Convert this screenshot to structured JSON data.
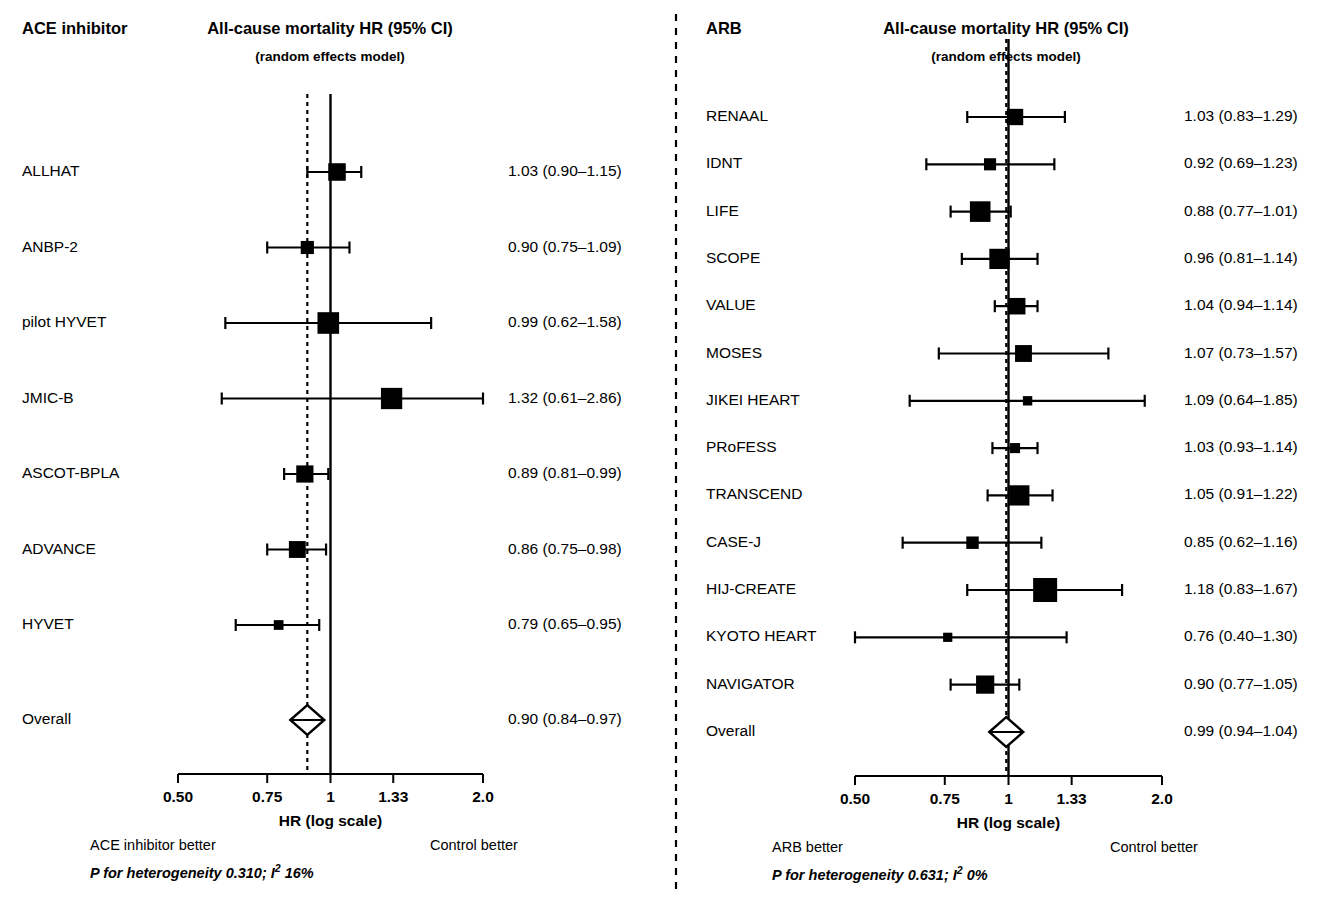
{
  "figure": {
    "title_common": "All-cause mortality HR (95% CI)",
    "subtitle_common": "(random effects model)",
    "axis_title": "HR (log scale)",
    "control_label": "Control better",
    "overall_label": "Overall",
    "tick_labels": [
      "0.50",
      "0.75",
      "1",
      "1.33",
      "2.0"
    ],
    "tick_values": [
      0.5,
      0.75,
      1,
      1.33,
      2.0
    ],
    "axis_min": 0.5,
    "axis_max": 2.0,
    "null_value": 1,
    "line_color": "#000000",
    "background_color": "#ffffff"
  },
  "panels": [
    {
      "id": "ace-inhibitor",
      "group_label": "ACE inhibitor",
      "title": "All-cause mortality HR (95% CI)",
      "subtitle": "(random effects model)",
      "better_label": "ACE inhibitor better",
      "control_label": "Control better",
      "axis_title": "HR (log scale)",
      "heterogeneity": {
        "prefix": "P for heterogeneity 0.310; I",
        "sup": "2",
        "suffix": " 16%",
        "p_value": "0.310",
        "i2": "16%",
        "full": "P for heterogeneity 0.310; I2 16%"
      },
      "overall": {
        "label": "Overall",
        "value_text": "0.90 (0.84–0.97)",
        "hr": 0.9,
        "lower": 0.84,
        "upper": 0.97
      },
      "studies": [
        {
          "label": "ALLHAT",
          "value_text": "1.03 (0.90–1.15)",
          "hr": 1.03,
          "lower": 0.9,
          "upper": 1.15,
          "weight": 0.62
        },
        {
          "label": "ANBP-2",
          "value_text": "0.90 (0.75–1.09)",
          "hr": 0.9,
          "lower": 0.75,
          "upper": 1.09,
          "weight": 0.36
        },
        {
          "label": "pilot HYVET",
          "value_text": "0.99 (0.62–1.58)",
          "hr": 0.99,
          "lower": 0.62,
          "upper": 1.58,
          "weight": 0.86
        },
        {
          "label": "JMIC-B",
          "value_text": "1.32 (0.61–2.86)",
          "hr": 1.32,
          "lower": 0.61,
          "upper": 2.86,
          "weight": 0.84
        },
        {
          "label": "ASCOT-BPLA",
          "value_text": "0.89 (0.81–0.99)",
          "hr": 0.89,
          "lower": 0.81,
          "upper": 0.99,
          "weight": 0.6
        },
        {
          "label": "ADVANCE",
          "value_text": "0.86 (0.75–0.98)",
          "hr": 0.86,
          "lower": 0.75,
          "upper": 0.98,
          "weight": 0.58
        },
        {
          "label": "HYVET",
          "value_text": "0.79 (0.65–0.95)",
          "hr": 0.79,
          "lower": 0.65,
          "upper": 0.95,
          "weight": 0.16
        }
      ]
    },
    {
      "id": "arb",
      "group_label": "ARB",
      "title": "All-cause mortality HR (95% CI)",
      "subtitle": "(random effects model)",
      "better_label": "ARB better",
      "control_label": "Control better",
      "axis_title": "HR (log scale)",
      "heterogeneity": {
        "prefix": "P for heterogeneity 0.631; I",
        "sup": "2",
        "suffix": " 0%",
        "p_value": "0.631",
        "i2": "0%",
        "full": "P for heterogeneity 0.631; I2 0%"
      },
      "overall": {
        "label": "Overall",
        "value_text": "0.99 (0.94–1.04)",
        "hr": 0.99,
        "lower": 0.94,
        "upper": 1.04
      },
      "studies": [
        {
          "label": "RENAAL",
          "value_text": "1.03 (0.83–1.29)",
          "hr": 1.03,
          "lower": 0.83,
          "upper": 1.29,
          "weight": 0.55
        },
        {
          "label": "IDNT",
          "value_text": "0.92 (0.69–1.23)",
          "hr": 0.92,
          "lower": 0.69,
          "upper": 1.23,
          "weight": 0.3
        },
        {
          "label": "LIFE",
          "value_text": "0.88 (0.77–1.01)",
          "hr": 0.88,
          "lower": 0.77,
          "upper": 1.01,
          "weight": 0.8
        },
        {
          "label": "SCOPE",
          "value_text": "0.96 (0.81–1.14)",
          "hr": 0.96,
          "lower": 0.81,
          "upper": 1.14,
          "weight": 0.78
        },
        {
          "label": "VALUE",
          "value_text": "1.04 (0.94–1.14)",
          "hr": 1.04,
          "lower": 0.94,
          "upper": 1.14,
          "weight": 0.56
        },
        {
          "label": "MOSES",
          "value_text": "1.07 (0.73–1.57)",
          "hr": 1.07,
          "lower": 0.73,
          "upper": 1.57,
          "weight": 0.58
        },
        {
          "label": "JIKEI HEART",
          "value_text": "1.09 (0.64–1.85)",
          "hr": 1.09,
          "lower": 0.64,
          "upper": 1.85,
          "weight": 0.14
        },
        {
          "label": "PRoFESS",
          "value_text": "1.03 (0.93–1.14)",
          "hr": 1.03,
          "lower": 0.93,
          "upper": 1.14,
          "weight": 0.18
        },
        {
          "label": "TRANSCEND",
          "value_text": "1.05 (0.91–1.22)",
          "hr": 1.05,
          "lower": 0.91,
          "upper": 1.22,
          "weight": 0.78
        },
        {
          "label": "CASE-J",
          "value_text": "0.85 (0.62–1.16)",
          "hr": 0.85,
          "lower": 0.62,
          "upper": 1.16,
          "weight": 0.32
        },
        {
          "label": "HIJ-CREATE",
          "value_text": "1.18 (0.83–1.67)",
          "hr": 1.18,
          "lower": 0.83,
          "upper": 1.67,
          "weight": 1.0
        },
        {
          "label": "KYOTO HEART",
          "value_text": "0.76 (0.40–1.30)",
          "hr": 0.76,
          "lower": 0.4,
          "upper": 1.3,
          "weight": 0.13
        },
        {
          "label": "NAVIGATOR",
          "value_text": "0.90 (0.77–1.05)",
          "hr": 0.9,
          "lower": 0.77,
          "upper": 1.05,
          "weight": 0.66
        }
      ]
    }
  ],
  "chart_data": {
    "type": "forest",
    "xlabel": "HR (log scale)",
    "scale": "log",
    "xlim": [
      0.5,
      2.0
    ],
    "xticks": [
      0.5,
      0.75,
      1,
      1.33,
      2.0
    ],
    "xticklabels": [
      "0.50",
      "0.75",
      "1",
      "1.33",
      "2.0"
    ],
    "reference_line": 1,
    "grid": false,
    "legend": "none",
    "panels": [
      {
        "name": "ACE inhibitor",
        "categories": [
          "ALLHAT",
          "ANBP-2",
          "pilot HYVET",
          "JMIC-B",
          "ASCOT-BPLA",
          "ADVANCE",
          "HYVET",
          "Overall"
        ],
        "values": [
          1.03,
          0.9,
          0.99,
          1.32,
          0.89,
          0.86,
          0.79,
          0.9
        ],
        "ci_lower": [
          0.9,
          0.75,
          0.62,
          0.61,
          0.81,
          0.75,
          0.65,
          0.84
        ],
        "ci_upper": [
          1.15,
          1.09,
          1.58,
          2.86,
          0.99,
          0.98,
          0.95,
          0.97
        ],
        "labels": [
          "1.03 (0.90–1.15)",
          "0.90 (0.75–1.09)",
          "0.99 (0.62–1.58)",
          "1.32 (0.61–2.86)",
          "0.89 (0.81–0.99)",
          "0.86 (0.75–0.98)",
          "0.79 (0.65–0.95)",
          "0.90 (0.84–0.97)"
        ],
        "pooled_line": 0.9,
        "heterogeneity_p": 0.31,
        "i_squared": "16%",
        "annotations": [
          "ACE inhibitor better",
          "Control better"
        ]
      },
      {
        "name": "ARB",
        "categories": [
          "RENAAL",
          "IDNT",
          "LIFE",
          "SCOPE",
          "VALUE",
          "MOSES",
          "JIKEI HEART",
          "PRoFESS",
          "TRANSCEND",
          "CASE-J",
          "HIJ-CREATE",
          "KYOTO HEART",
          "NAVIGATOR",
          "Overall"
        ],
        "values": [
          1.03,
          0.92,
          0.88,
          0.96,
          1.04,
          1.07,
          1.09,
          1.03,
          1.05,
          0.85,
          1.18,
          0.76,
          0.9,
          0.99
        ],
        "ci_lower": [
          0.83,
          0.69,
          0.77,
          0.81,
          0.94,
          0.73,
          0.64,
          0.93,
          0.91,
          0.62,
          0.83,
          0.4,
          0.77,
          0.94
        ],
        "ci_upper": [
          1.29,
          1.23,
          1.01,
          1.14,
          1.14,
          1.57,
          1.85,
          1.14,
          1.22,
          1.16,
          1.67,
          1.3,
          1.05,
          1.04
        ],
        "labels": [
          "1.03 (0.83–1.29)",
          "0.92 (0.69–1.23)",
          "0.88 (0.77–1.01)",
          "0.96 (0.81–1.14)",
          "1.04 (0.94–1.14)",
          "1.07 (0.73–1.57)",
          "1.09 (0.64–1.85)",
          "1.03 (0.93–1.14)",
          "1.05 (0.91–1.22)",
          "0.85 (0.62–1.16)",
          "1.18 (0.83–1.67)",
          "0.76 (0.40–1.30)",
          "0.90 (0.77–1.05)",
          "0.99 (0.94–1.04)"
        ],
        "pooled_line": 0.99,
        "heterogeneity_p": 0.631,
        "i_squared": "0%",
        "annotations": [
          "ARB better",
          "Control better"
        ]
      }
    ]
  }
}
